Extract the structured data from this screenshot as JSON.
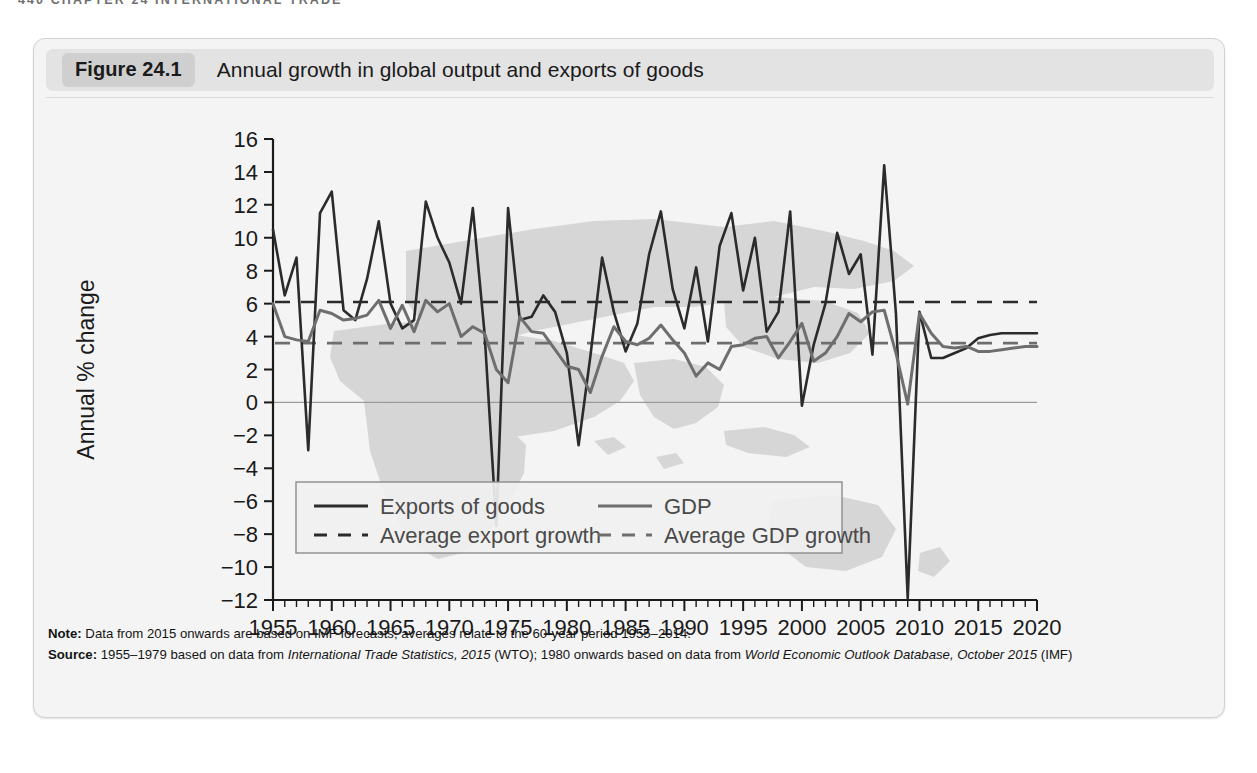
{
  "running_head": "440  CHAPTER 24  INTERNATIONAL TRADE",
  "figure": {
    "badge": "Figure 24.1",
    "title": "Annual growth in global output and exports of goods"
  },
  "notes": {
    "note_label": "Note:",
    "note_text": " Data from 2015 onwards are based on IMF forecasts; averages relate to the 60-year period 1955–2014.",
    "source_label": "Source:",
    "source_part1": " 1955–1979 based on data from ",
    "source_italic1": "International Trade Statistics, 2015",
    "source_part2": " (WTO); 1980 onwards based on data from ",
    "source_italic2": "World Economic Outlook Database, October 2015",
    "source_part3": " (IMF)"
  },
  "colors": {
    "exports_line": "#2b2b2b",
    "gdp_line": "#6e6e6e",
    "average_exports_line": "#2b2b2b",
    "average_gdp_line": "#6e6e6e",
    "axis": "#1a1a1a",
    "zero_line": "#9a9a9a",
    "map_silhouette": "#d6d6d6",
    "card_background": "#f4f4f4",
    "header_background": "#e3e3e3",
    "badge_background": "#cfcfcf"
  },
  "chart_data": {
    "type": "line",
    "title": "Annual growth in global output and exports of goods",
    "xlabel": "",
    "ylabel": "Annual % change",
    "xlim": [
      1955,
      2020
    ],
    "ylim": [
      -12,
      16
    ],
    "ytick_step": 2,
    "yticks": [
      -12,
      -10,
      -8,
      -6,
      -4,
      -2,
      0,
      2,
      4,
      6,
      8,
      10,
      12,
      14,
      16
    ],
    "xticks_labeled": [
      1955,
      1960,
      1965,
      1970,
      1975,
      1980,
      1985,
      1990,
      1995,
      2000,
      2005,
      2010,
      2015,
      2020
    ],
    "xtick_minor_step": 1,
    "grid": false,
    "legend_position": "bottom-left-inside",
    "legend": [
      {
        "key": "exports",
        "label": "Exports of goods",
        "style": "solid",
        "color": "#2b2b2b"
      },
      {
        "key": "gdp",
        "label": "GDP",
        "style": "solid",
        "color": "#6e6e6e"
      },
      {
        "key": "avg_exports",
        "label": "Average export growth",
        "style": "dashed",
        "color": "#2b2b2b"
      },
      {
        "key": "avg_gdp",
        "label": "Average GDP growth",
        "style": "dashed",
        "color": "#6e6e6e"
      }
    ],
    "x": [
      1955,
      1956,
      1957,
      1958,
      1959,
      1960,
      1961,
      1962,
      1963,
      1964,
      1965,
      1966,
      1967,
      1968,
      1969,
      1970,
      1971,
      1972,
      1973,
      1974,
      1975,
      1976,
      1977,
      1978,
      1979,
      1980,
      1981,
      1982,
      1983,
      1984,
      1985,
      1986,
      1987,
      1988,
      1989,
      1990,
      1991,
      1992,
      1993,
      1994,
      1995,
      1996,
      1997,
      1998,
      1999,
      2000,
      2001,
      2002,
      2003,
      2004,
      2005,
      2006,
      2007,
      2008,
      2009,
      2010,
      2011,
      2012,
      2013,
      2014,
      2015,
      2016,
      2017,
      2018,
      2019,
      2020
    ],
    "series": [
      {
        "name": "Exports of goods",
        "color": "#2b2b2b",
        "style": "solid",
        "values": [
          10.5,
          6.5,
          8.8,
          -2.9,
          11.5,
          12.8,
          5.6,
          5.0,
          7.5,
          11.0,
          6.0,
          4.5,
          5.0,
          12.2,
          10.0,
          8.5,
          6.0,
          11.8,
          4.2,
          -7.5,
          11.8,
          5.0,
          5.2,
          6.5,
          5.5,
          3.0,
          -2.6,
          2.8,
          8.8,
          5.5,
          3.1,
          4.8,
          9.0,
          11.6,
          6.9,
          4.5,
          8.2,
          3.7,
          9.5,
          11.5,
          6.8,
          10.0,
          4.3,
          5.5,
          11.6,
          -0.2,
          3.5,
          6.0,
          10.3,
          7.8,
          9.0,
          2.9,
          14.4,
          5.4,
          -11.9,
          5.5,
          2.7,
          2.7,
          3.0,
          3.3,
          3.9,
          4.1,
          4.2,
          4.2,
          4.2,
          4.2
        ],
        "note": "values read from chart; negative spikes at 1958, 1975, 1982, 2001, 2009"
      },
      {
        "name": "GDP",
        "color": "#6e6e6e",
        "style": "solid",
        "values": [
          6.0,
          4.0,
          3.8,
          3.7,
          5.6,
          5.4,
          5.0,
          5.1,
          5.3,
          6.2,
          4.5,
          5.9,
          4.3,
          6.2,
          5.5,
          6.0,
          4.0,
          4.6,
          4.2,
          2.0,
          1.2,
          5.2,
          4.3,
          4.2,
          3.2,
          2.2,
          2.0,
          0.6,
          2.8,
          4.6,
          3.7,
          3.5,
          3.9,
          4.7,
          3.8,
          3.0,
          1.6,
          2.4,
          2.0,
          3.4,
          3.5,
          3.9,
          4.0,
          2.7,
          3.7,
          4.8,
          2.5,
          3.0,
          4.0,
          5.4,
          4.9,
          5.5,
          5.6,
          3.0,
          -0.1,
          5.4,
          4.2,
          3.4,
          3.3,
          3.4,
          3.1,
          3.1,
          3.2,
          3.3,
          3.4,
          3.4
        ],
        "note": "values read from chart; trough at 2009 (-0.1)"
      }
    ],
    "reference_lines": [
      {
        "name": "Average export growth",
        "value": 6.1,
        "color": "#2b2b2b",
        "style": "dashed"
      },
      {
        "name": "Average GDP growth",
        "value": 3.6,
        "color": "#6e6e6e",
        "style": "dashed"
      }
    ]
  }
}
